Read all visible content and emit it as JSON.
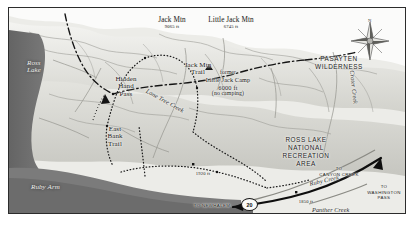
{
  "figure": {
    "kind": "topographic-shaded-relief-map",
    "region": "Jack Mountain / Ross Lake National Recreation Area, North Cascades"
  },
  "colors": {
    "page_bg": "#ffffff",
    "frame_border": "#2c2c2c",
    "land_light": "#ededea",
    "land_mid": "#d8d8d3",
    "land_shade": "#b9b9b3",
    "water_dark": "#6f6f6f",
    "water_mid": "#8a8a8a",
    "ink": "#1b1b1b",
    "trail_ink": "#141414",
    "road_ink": "#101010"
  },
  "peaks": [
    {
      "name": "Jack Mtn",
      "elevation": "9065 ft"
    },
    {
      "name": "Little Jack Mtn",
      "elevation": "6745 ft"
    }
  ],
  "water_labels": [
    {
      "name": "Ross\nLake"
    },
    {
      "name": "Ruby Arm"
    }
  ],
  "creeks": [
    {
      "name": "Lone Tree Creek"
    },
    {
      "name": "Crater Creek"
    },
    {
      "name": "Ruby Creek"
    },
    {
      "name": "Panther Creek"
    }
  ],
  "trails": [
    {
      "name": "Jack Mtn\nTrail"
    },
    {
      "name": "East\nBank\nTrail"
    },
    {
      "name": "Hidden\nHand\nPass"
    }
  ],
  "areas": [
    {
      "name": "PASAYTEN\nWILDERNESS"
    },
    {
      "name": "ROSS LAKE\nNATIONAL\nRECREATION\nAREA"
    }
  ],
  "camp": {
    "qualifier": "former",
    "name": "Little Jack Camp",
    "elevation": "6000 ft",
    "note": "(no camping)"
  },
  "spot_elevations": [
    {
      "value": "1920 ft"
    },
    {
      "value": "1850 ft"
    }
  ],
  "destinations": [
    {
      "name": "TO\nCANYON CREEK"
    },
    {
      "name": "TO\nWASHINGTON\nPASS"
    },
    {
      "name": "TO NEWHALEM"
    }
  ],
  "highway": {
    "shield_number": "20"
  },
  "compass": {
    "north_label": "N"
  }
}
